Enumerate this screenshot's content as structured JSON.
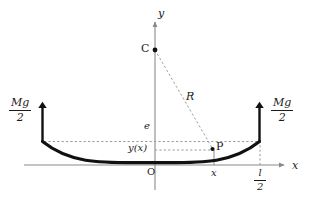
{
  "figure": {
    "kind": "physics-free-body-diagram",
    "background_color": "#ffffff",
    "ink_color": "#1a1a1a",
    "axis_color": "#808080",
    "dash_color": "#999999",
    "curve_color": "#111111"
  },
  "axes": {
    "y_axis_label": "y",
    "x_axis_label": "x",
    "origin_label": "O"
  },
  "forces": {
    "left": {
      "numerator": "Mg",
      "denominator": "2"
    },
    "right": {
      "numerator": "Mg",
      "denominator": "2"
    }
  },
  "points": {
    "center": {
      "label": "C",
      "x": 155,
      "y": 50
    },
    "on_curve": {
      "label": "P",
      "x": 212,
      "y": 148
    }
  },
  "annotations": {
    "radius_label": "R",
    "sag_level_label": "e",
    "deflection_label": "y(x)",
    "abscissa_label": "x",
    "half_span": {
      "numerator": "l",
      "denominator": "2"
    }
  },
  "geometry": {
    "x_axis_y": 165,
    "y_axis_x": 155,
    "beam_left_x": 42,
    "beam_right_x": 260,
    "beam_end_y": 142,
    "beam_vertex_y": 162,
    "arrow_top_y": 105,
    "yx_level_y": 150
  }
}
